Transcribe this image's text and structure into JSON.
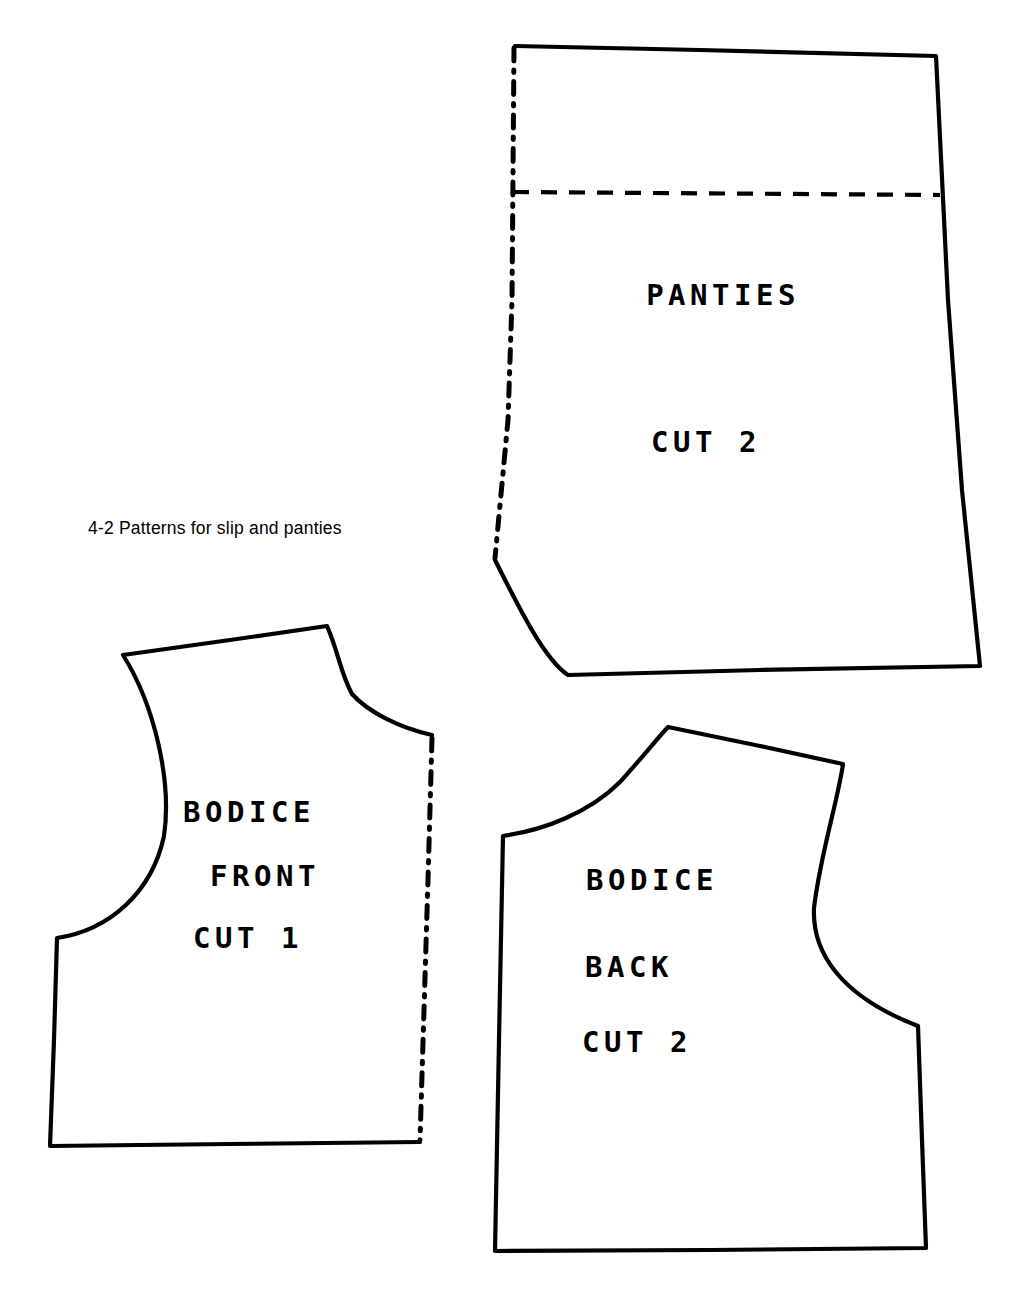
{
  "figure": {
    "caption": "4-2  Patterns for slip and panties",
    "caption_number": "4-2",
    "caption_text": "Patterns for slip and panties",
    "background_color": "#ffffff",
    "ink_color": "#000000"
  },
  "pieces": [
    {
      "id": "panties",
      "name_line_1": "PANTIES",
      "name_line_2": "CUT 2",
      "quantity": "CUT 2",
      "fold_edge": "left",
      "has_dashed_guide_line": true
    },
    {
      "id": "bodice-front",
      "name_line_1": "BODICE",
      "name_line_2": "FRONT",
      "name_line_3": "CUT 1",
      "quantity": "CUT 1",
      "fold_edge": "right",
      "has_dashed_guide_line": false
    },
    {
      "id": "bodice-back",
      "name_line_1": "BODICE",
      "name_line_2": "BACK",
      "name_line_3": "CUT 2",
      "quantity": "CUT 2",
      "fold_edge": "none",
      "has_dashed_guide_line": false
    }
  ]
}
